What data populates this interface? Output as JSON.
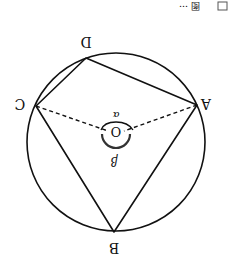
{
  "figure": {
    "caption_fragment": "图 ⋯",
    "rotation_deg": 180,
    "circle": {
      "cx": 116,
      "cy": 142,
      "r": 89
    },
    "points": {
      "A": {
        "label": "A",
        "x": 197,
        "y": 105
      },
      "B": {
        "label": "B",
        "x": 114,
        "y": 232
      },
      "C": {
        "label": "C",
        "x": 36,
        "y": 106
      },
      "D": {
        "label": "D",
        "x": 86,
        "y": 58
      },
      "O": {
        "label": "O",
        "x": 116,
        "y": 132
      }
    },
    "angles": {
      "alpha": "α",
      "beta": "β"
    },
    "colors": {
      "stroke": "#111111",
      "background": "#ffffff"
    }
  }
}
